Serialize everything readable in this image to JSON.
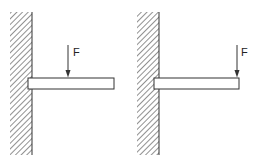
{
  "diagram": {
    "colors": {
      "stroke": "#333333",
      "hatch": "#555555",
      "background": "#ffffff"
    },
    "panels": [
      {
        "id": "left",
        "wall": {
          "x": 10,
          "y": 12,
          "width": 22,
          "height": 143,
          "edge_x": 32
        },
        "beam": {
          "x": 28,
          "y": 78,
          "width": 86,
          "height": 11
        },
        "force": {
          "label": "F",
          "x": 68,
          "y1": 45,
          "y2": 77,
          "label_x": 73,
          "label_y": 56,
          "position": "mid-span"
        }
      },
      {
        "id": "right",
        "wall": {
          "x": 137,
          "y": 12,
          "width": 22,
          "height": 143,
          "edge_x": 159
        },
        "beam": {
          "x": 154,
          "y": 78,
          "width": 85,
          "height": 11
        },
        "force": {
          "label": "F",
          "x": 237,
          "y1": 45,
          "y2": 77,
          "label_x": 241,
          "label_y": 56,
          "position": "free-end"
        }
      }
    ]
  }
}
